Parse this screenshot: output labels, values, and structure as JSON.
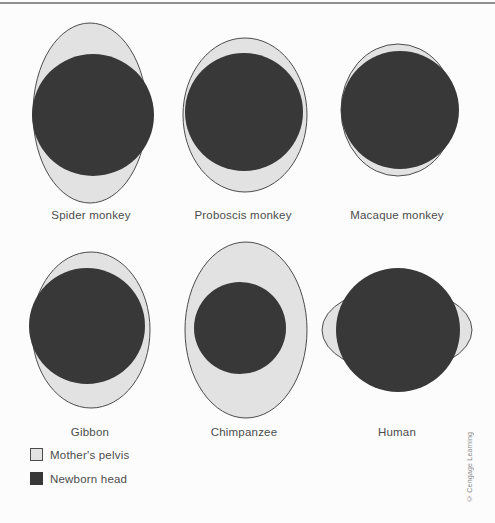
{
  "figure": {
    "title_semantic": "Comparison of mother's pelvis opening size and newborn head size in six primates",
    "colors": {
      "background": "#fcfcfc",
      "pelvis_fill": "#e2e2e2",
      "pelvis_stroke": "#4c4c4c",
      "head_fill": "#383838",
      "label_text": "#4c4c4c",
      "top_rule": "#8f8f8f"
    }
  },
  "panels": [
    {
      "label": "Spider monkey",
      "label_x": 91,
      "label_y": 209,
      "pelvis": {
        "cx": 90,
        "cy": 113,
        "rx": 57,
        "ry": 90
      },
      "head": {
        "cx": 93,
        "cy": 115,
        "r": 61
      },
      "relation": "head slightly wider than pelvis opening"
    },
    {
      "label": "Proboscis monkey",
      "label_x": 243,
      "label_y": 209,
      "pelvis": {
        "cx": 245,
        "cy": 115,
        "rx": 62,
        "ry": 77
      },
      "head": {
        "cx": 244,
        "cy": 112,
        "r": 59
      },
      "relation": "head nearly fills pelvis opening"
    },
    {
      "label": "Macaque monkey",
      "label_x": 397,
      "label_y": 209,
      "pelvis": {
        "cx": 398,
        "cy": 110,
        "rx": 57,
        "ry": 66
      },
      "head": {
        "cx": 400,
        "cy": 110,
        "r": 59
      },
      "relation": "head about same size as pelvis opening"
    },
    {
      "label": "Gibbon",
      "label_x": 90,
      "label_y": 426,
      "pelvis": {
        "cx": 91,
        "cy": 330,
        "rx": 59,
        "ry": 78
      },
      "head": {
        "cx": 87,
        "cy": 326,
        "r": 58
      },
      "relation": "head nearly fills pelvis opening"
    },
    {
      "label": "Chimpanzee",
      "label_x": 244,
      "label_y": 426,
      "pelvis": {
        "cx": 246,
        "cy": 330,
        "rx": 61,
        "ry": 88
      },
      "head": {
        "cx": 240,
        "cy": 328,
        "r": 46
      },
      "relation": "head much smaller than pelvis opening"
    },
    {
      "label": "Human",
      "label_x": 397,
      "label_y": 426,
      "pelvis": {
        "cx": 397,
        "cy": 330,
        "rx": 75,
        "ry": 42
      },
      "head": {
        "cx": 398,
        "cy": 330,
        "r": 62
      },
      "relation": "head taller than pelvis opening, overflows top and bottom"
    }
  ],
  "legend": {
    "items": [
      {
        "label": "Mother's pelvis",
        "swatch": "pelvis"
      },
      {
        "label": "Newborn head",
        "swatch": "head"
      }
    ]
  },
  "credit": "© Cengage Learning"
}
